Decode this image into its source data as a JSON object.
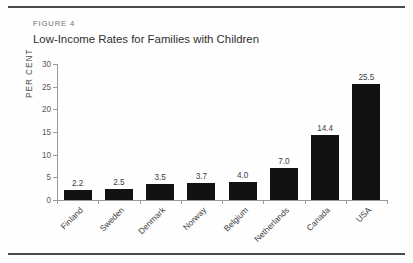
{
  "figure": {
    "number_label": "FIGURE 4",
    "title": "Low-Income Rates for Families with Children"
  },
  "chart_data": {
    "type": "bar",
    "title": "Low-Income Rates for Families with Children",
    "xlabel": "",
    "ylabel": "PER CENT",
    "ylim": [
      0,
      30
    ],
    "yticks": [
      0,
      5,
      10,
      15,
      20,
      25,
      30
    ],
    "grid": false,
    "legend": null,
    "categories": [
      "Finland",
      "Sweden",
      "Denmark",
      "Norway",
      "Belgium",
      "Netherlands",
      "Canada",
      "USA"
    ],
    "values": [
      2.2,
      2.5,
      3.5,
      3.7,
      4.0,
      7.0,
      14.4,
      25.5
    ],
    "value_labels": [
      "2.2",
      "2.5",
      "3.5",
      "3.7",
      "4.0",
      "7.0",
      "14.4",
      "25.5"
    ],
    "bar_color": "#121212",
    "axis_color": "#9a9a9a"
  }
}
